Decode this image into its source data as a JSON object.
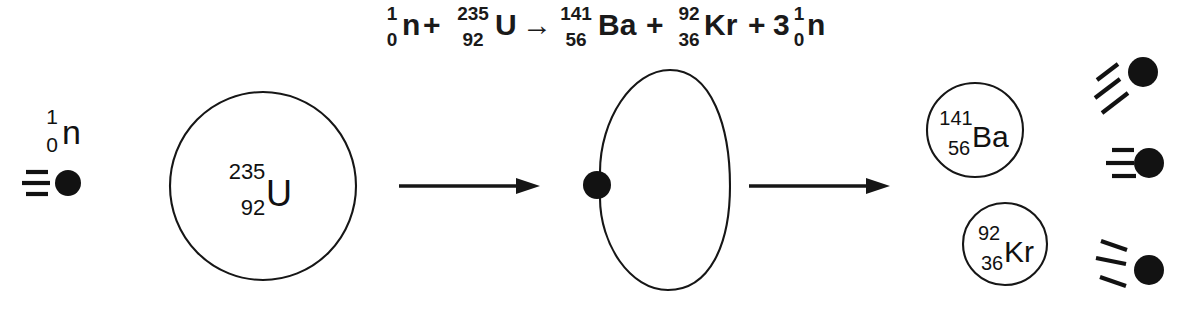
{
  "diagram": {
    "background_color": "#ffffff",
    "ink_color": "#121212",
    "equation": {
      "parts": {
        "n_mass": "1",
        "n_charge": "0",
        "n_symbol": "n",
        "plus_1": "+",
        "u_mass": "235",
        "u_charge": "92",
        "u_symbol": "U",
        "arrow": "→",
        "ba_mass": "141",
        "ba_charge": "56",
        "ba_symbol": "Ba",
        "plus_2": "+",
        "kr_mass": "92",
        "kr_charge": "36",
        "kr_symbol": "Kr",
        "plus_3": "+",
        "coefficient_3": "3",
        "n2_mass": "1",
        "n2_charge": "0",
        "n2_symbol": "n"
      },
      "plain_text": "1/0 n + 235/92 U → 141/56 Ba + 92/36 Kr + 3 1/0 n"
    },
    "incident_neutron": {
      "label_mass": "1",
      "label_charge": "0",
      "label_symbol": "n",
      "speed_lines": 3,
      "direction": "right"
    },
    "uranium_nucleus": {
      "mass_number": "235",
      "atomic_number": "92",
      "symbol": "U",
      "shape": "circle"
    },
    "compound_nucleus": {
      "shape": "deformed-bean",
      "absorbed_neutron": true
    },
    "barium_nucleus": {
      "mass_number": "141",
      "atomic_number": "56",
      "symbol": "Ba",
      "shape": "circle"
    },
    "krypton_nucleus": {
      "mass_number": "92",
      "atomic_number": "36",
      "symbol": "Kr",
      "shape": "circle"
    },
    "emitted_neutrons": [
      {
        "id": "neutron-top",
        "direction": "up-right",
        "speed_lines": 3
      },
      {
        "id": "neutron-middle",
        "direction": "right",
        "speed_lines": 3
      },
      {
        "id": "neutron-bottom",
        "direction": "down-right",
        "speed_lines": 3
      }
    ],
    "arrows": [
      {
        "id": "arrow-capture",
        "direction": "right"
      },
      {
        "id": "arrow-fission",
        "direction": "right"
      }
    ]
  }
}
